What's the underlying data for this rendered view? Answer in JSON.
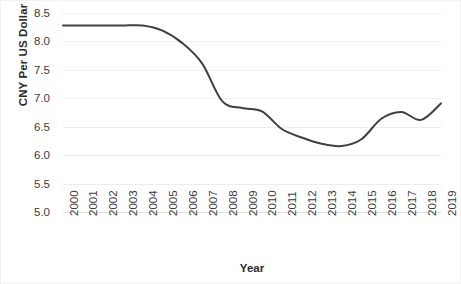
{
  "chart_data": {
    "type": "line",
    "title": "",
    "xlabel": "Year",
    "ylabel": "CNY Per US Dollar",
    "x": [
      2000,
      2001,
      2002,
      2003,
      2004,
      2005,
      2006,
      2007,
      2008,
      2009,
      2010,
      2011,
      2012,
      2013,
      2014,
      2015,
      2016,
      2017,
      2018,
      2019
    ],
    "categories": [
      "2000",
      "2001",
      "2002",
      "2003",
      "2004",
      "2005",
      "2006",
      "2007",
      "2008",
      "2009",
      "2010",
      "2011",
      "2012",
      "2013",
      "2014",
      "2015",
      "2016",
      "2017",
      "2018",
      "2019"
    ],
    "values": [
      8.28,
      8.28,
      8.28,
      8.28,
      8.28,
      8.19,
      7.97,
      7.61,
      6.95,
      6.83,
      6.77,
      6.46,
      6.31,
      6.2,
      6.16,
      6.28,
      6.64,
      6.76,
      6.62,
      6.91
    ],
    "series": [
      {
        "name": "CNY Per US Dollar",
        "values": [
          8.28,
          8.28,
          8.28,
          8.28,
          8.28,
          8.19,
          7.97,
          7.61,
          6.95,
          6.83,
          6.77,
          6.46,
          6.31,
          6.2,
          6.16,
          6.28,
          6.64,
          6.76,
          6.62,
          6.91
        ]
      }
    ],
    "ylim": [
      5.0,
      8.5
    ],
    "y_ticks": [
      "5.0",
      "5.5",
      "6.0",
      "6.5",
      "7.0",
      "7.5",
      "8.0",
      "8.5"
    ],
    "y_tick_values": [
      5.0,
      5.5,
      6.0,
      6.5,
      7.0,
      7.5,
      8.0,
      8.5
    ],
    "grid": "horizontal",
    "legend": "none",
    "line_color": "#404040",
    "gridline_color": "#ededed",
    "background_color": "#ffffff",
    "smooth": true
  }
}
